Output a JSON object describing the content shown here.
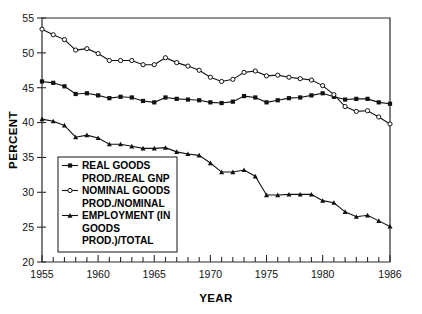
{
  "chart_data": {
    "type": "line",
    "title": "",
    "xlabel": "YEAR",
    "ylabel": "PERCENT",
    "xlim": [
      1955,
      1986
    ],
    "ylim": [
      20,
      55
    ],
    "xticks": [
      1955,
      1960,
      1965,
      1970,
      1975,
      1980,
      1986
    ],
    "xtick_labels": [
      "1955",
      "1960",
      "1965",
      "1970",
      "1975",
      "1980",
      "1986"
    ],
    "yticks": [
      20,
      25,
      30,
      35,
      40,
      45,
      50,
      55
    ],
    "ytick_labels": [
      "20",
      "25",
      "30",
      "35",
      "40",
      "45",
      "50",
      "55"
    ],
    "minor_xticks_every": 1,
    "grid": false,
    "legend_position": "lower-left-inside",
    "x": [
      1955,
      1956,
      1957,
      1958,
      1959,
      1960,
      1961,
      1962,
      1963,
      1964,
      1965,
      1966,
      1967,
      1968,
      1969,
      1970,
      1971,
      1972,
      1973,
      1974,
      1975,
      1976,
      1977,
      1978,
      1979,
      1980,
      1981,
      1982,
      1983,
      1984,
      1985,
      1986
    ],
    "series": [
      {
        "name": "REAL GOODS PROD./REAL GNP",
        "marker": "filled-square",
        "values": [
          45.9,
          45.7,
          45.2,
          44.1,
          44.2,
          43.9,
          43.5,
          43.7,
          43.6,
          43.1,
          42.9,
          43.6,
          43.4,
          43.3,
          43.2,
          42.9,
          42.8,
          43.0,
          43.8,
          43.6,
          42.9,
          43.2,
          43.5,
          43.6,
          43.9,
          44.2,
          43.7,
          43.3,
          43.4,
          43.4,
          42.9,
          42.7
        ]
      },
      {
        "name": "NOMINAL GOODS PROD./NOMINAL",
        "marker": "open-circle",
        "values": [
          53.4,
          52.6,
          51.9,
          50.4,
          50.6,
          49.9,
          48.9,
          48.9,
          48.9,
          48.3,
          48.3,
          49.3,
          48.6,
          48.1,
          47.5,
          46.5,
          45.9,
          46.2,
          47.2,
          47.4,
          46.7,
          46.8,
          46.5,
          46.3,
          46.1,
          45.3,
          44.0,
          42.3,
          41.6,
          41.7,
          40.8,
          39.8
        ]
      },
      {
        "name": "EMPLOYMENT (IN GOODS PROD.)/TOTAL",
        "marker": "filled-triangle",
        "values": [
          40.5,
          40.2,
          39.6,
          37.9,
          38.2,
          37.8,
          36.9,
          36.9,
          36.6,
          36.3,
          36.3,
          36.4,
          35.8,
          35.5,
          35.3,
          34.2,
          32.9,
          32.9,
          33.2,
          32.3,
          29.6,
          29.6,
          29.7,
          29.7,
          29.7,
          28.8,
          28.5,
          27.2,
          26.5,
          26.7,
          25.9,
          25.1
        ]
      }
    ]
  },
  "legend": {
    "items": [
      {
        "label_line1": "REAL GOODS",
        "label_line2": "PROD./REAL GNP",
        "marker": "filled-square"
      },
      {
        "label_line1": "NOMINAL GOODS",
        "label_line2": "PROD./NOMINAL",
        "marker": "open-circle"
      },
      {
        "label_line1": "EMPLOYMENT (IN",
        "label_line2": "GOODS",
        "label_line3": "PROD.)/TOTAL",
        "marker": "filled-triangle"
      }
    ]
  },
  "colors": {
    "ink": "#111111",
    "axis": "#2b2b2b",
    "background": "#ffffff"
  }
}
